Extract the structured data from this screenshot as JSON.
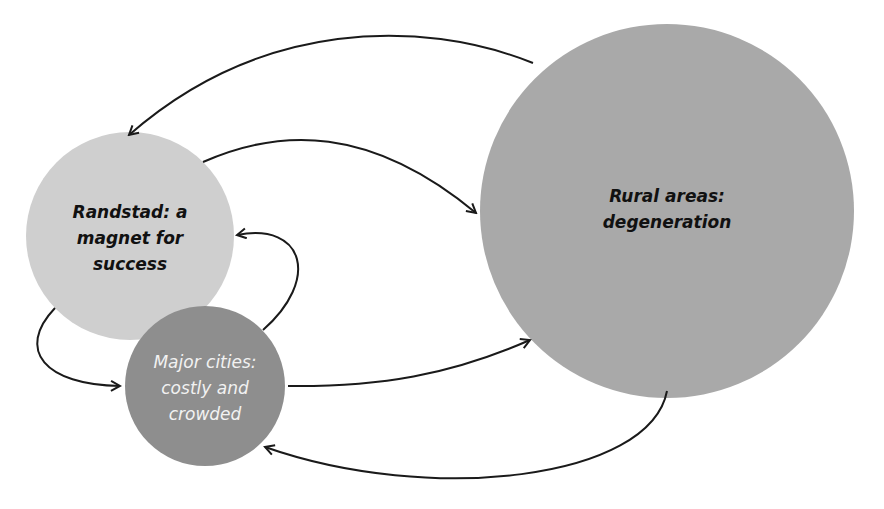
{
  "diagram": {
    "type": "cycle-diagram",
    "nodes": [
      {
        "id": "randstad",
        "label": "Randstad: a\nmagnet for\nsuccess",
        "fill": "#cfcfcf",
        "text_color": "#111111",
        "cx": 130,
        "cy": 236,
        "r": 104
      },
      {
        "id": "major_cities",
        "label": "Major cities:\ncostly and\ncrowded",
        "fill": "#8e8e8e",
        "text_color": "#f2f2f2",
        "cx": 205,
        "cy": 386,
        "r": 80
      },
      {
        "id": "rural",
        "label": "Rural areas:\ndegeneration",
        "fill": "#a9a9a9",
        "text_color": "#111111",
        "cx": 667,
        "cy": 211,
        "r": 187
      }
    ],
    "edges": [
      {
        "from": "rural",
        "to": "randstad",
        "label": ""
      },
      {
        "from": "randstad",
        "to": "rural",
        "label": ""
      },
      {
        "from": "major_cities",
        "to": "randstad",
        "label": ""
      },
      {
        "from": "randstad",
        "to": "major_cities",
        "label": ""
      },
      {
        "from": "major_cities",
        "to": "rural",
        "label": ""
      },
      {
        "from": "rural",
        "to": "major_cities",
        "label": ""
      }
    ],
    "line_color": "#1a1a1a"
  }
}
